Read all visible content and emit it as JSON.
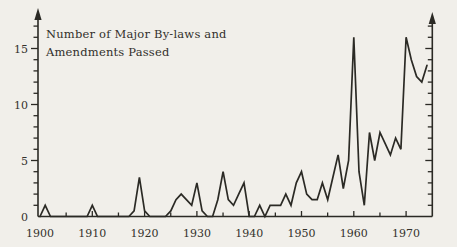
{
  "page": {
    "background_color": "#f1efea",
    "ink_color": "#2b2a25",
    "text_color": "#34322c"
  },
  "chart_data": {
    "type": "line",
    "title": "Number of Major By-laws and Amendments Passed",
    "title_lines": [
      "Number of Major By-laws and",
      "Amendments Passed"
    ],
    "xlabel": "",
    "ylabel": "",
    "xlim": [
      1900,
      1975
    ],
    "ylim": [
      0,
      17
    ],
    "grid": false,
    "legend": "none",
    "x_tick_step_years": 5,
    "x_tick_labels": [
      "1900",
      "1910",
      "1920",
      "1930",
      "1940",
      "1950",
      "1960",
      "1970"
    ],
    "y_tick_step": 1,
    "y_tick_labels": [
      "0",
      "5",
      "10",
      "15"
    ],
    "y_label_values": [
      0,
      5,
      10,
      15
    ],
    "line_color": "#2b2a25",
    "series": [
      {
        "name": "major-bylaws-and-amendments-passed",
        "years": [
          1900,
          1901,
          1902,
          1903,
          1904,
          1905,
          1906,
          1907,
          1908,
          1909,
          1910,
          1911,
          1912,
          1913,
          1914,
          1915,
          1916,
          1917,
          1918,
          1919,
          1920,
          1921,
          1922,
          1923,
          1924,
          1925,
          1926,
          1927,
          1928,
          1929,
          1930,
          1931,
          1932,
          1933,
          1934,
          1935,
          1936,
          1937,
          1938,
          1939,
          1940,
          1941,
          1942,
          1943,
          1944,
          1945,
          1946,
          1947,
          1948,
          1949,
          1950,
          1951,
          1952,
          1953,
          1954,
          1955,
          1956,
          1957,
          1958,
          1959,
          1960,
          1961,
          1962,
          1963,
          1964,
          1965,
          1966,
          1967,
          1968,
          1969,
          1970,
          1971,
          1972,
          1973,
          1974
        ],
        "values": [
          0,
          1,
          0,
          0,
          0,
          0,
          0,
          0,
          0,
          0,
          1,
          0,
          0,
          0,
          0,
          0,
          0,
          0,
          0.5,
          3.5,
          0.5,
          0,
          0,
          0,
          0,
          0.5,
          1.5,
          2,
          1.5,
          1,
          3,
          0.5,
          0,
          0,
          1.5,
          4,
          1.5,
          1,
          2,
          3,
          0,
          0,
          1,
          0,
          1,
          1,
          1,
          2,
          1,
          3,
          4,
          2,
          1.5,
          1.5,
          3,
          1.5,
          3.5,
          5.5,
          2.5,
          5,
          16,
          4,
          1,
          7.5,
          5,
          7.5,
          6.5,
          5.5,
          7,
          6,
          16,
          14,
          12.5,
          12,
          13.5
        ]
      }
    ]
  }
}
